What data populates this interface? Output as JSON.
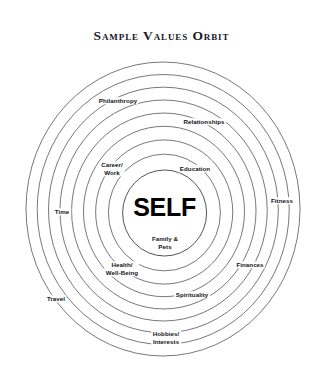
{
  "title": "Sample Values Orbit",
  "center": {
    "label": "SELF"
  },
  "colors": {
    "background": "#ffffff",
    "title_text": "#17171f",
    "ring_stroke": "#5f5f66",
    "inner_ring_stroke": "#4a4a52",
    "label_text": "#141418",
    "center_text": "#000000"
  },
  "diagram": {
    "type": "concentric-orbit",
    "ring_count": 9,
    "orbit_center_x": 163,
    "orbit_center_y": 209,
    "outer_radius_x": 137,
    "outer_radius_y": 147,
    "inner_radius_x": 42,
    "inner_radius_y": 43
  },
  "labels": [
    {
      "name": "family-pets",
      "text": "Family &\nPets",
      "line1": "Family &",
      "line2": "Pets",
      "x": 165,
      "y": 243,
      "two_line": true,
      "ring": 0
    },
    {
      "name": "career-work",
      "text": "Career/\nWork",
      "line1": "Career/",
      "line2": "Work",
      "x": 112,
      "y": 169,
      "two_line": true,
      "ring": 2
    },
    {
      "name": "education",
      "text": "Education",
      "line1": "Education",
      "line2": "",
      "x": 195,
      "y": 169,
      "two_line": false,
      "ring": 2
    },
    {
      "name": "health-wellbeing",
      "text": "Health/\nWell-Being",
      "line1": "Health/",
      "line2": "Well-Being",
      "x": 122,
      "y": 269,
      "two_line": true,
      "ring": 3
    },
    {
      "name": "relationships",
      "text": "Relationships",
      "line1": "Relationships",
      "line2": "",
      "x": 204,
      "y": 122,
      "two_line": false,
      "ring": 5
    },
    {
      "name": "spirituality",
      "text": "Spirituality",
      "line1": "Spirituality",
      "line2": "",
      "x": 192,
      "y": 295,
      "two_line": false,
      "ring": 5
    },
    {
      "name": "finances",
      "text": "Finances",
      "line1": "Finances",
      "line2": "",
      "x": 250,
      "y": 265,
      "two_line": false,
      "ring": 6
    },
    {
      "name": "philanthropy",
      "text": "Philanthropy",
      "line1": "Philanthropy",
      "line2": "",
      "x": 118,
      "y": 101,
      "two_line": false,
      "ring": 7
    },
    {
      "name": "fitness",
      "text": "Fitness",
      "line1": "Fitness",
      "line2": "",
      "x": 282,
      "y": 201,
      "two_line": false,
      "ring": 7
    },
    {
      "name": "time",
      "text": "Time",
      "line1": "Time",
      "line2": "",
      "x": 62,
      "y": 212,
      "two_line": false,
      "ring": 7
    },
    {
      "name": "travel",
      "text": "Travel",
      "line1": "Travel",
      "line2": "",
      "x": 56,
      "y": 299,
      "two_line": false,
      "ring": 8
    },
    {
      "name": "hobbies-interests",
      "text": "Hobbies/\nInterests",
      "line1": "Hobbies/",
      "line2": "Interests",
      "x": 166,
      "y": 338,
      "two_line": true,
      "ring": 8
    }
  ]
}
